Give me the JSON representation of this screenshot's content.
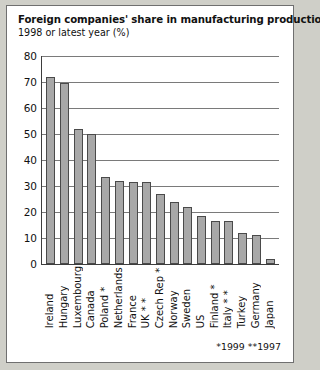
{
  "chart_data": {
    "type": "bar",
    "title": "Foreign companies' share in manufacturing production",
    "subtitle": "1998 or latest year (%)",
    "xlabel": "",
    "ylabel": "",
    "ylim": [
      0,
      80
    ],
    "yticks": [
      80,
      70,
      60,
      50,
      40,
      30,
      20,
      10,
      0
    ],
    "grid": true,
    "legend": null,
    "categories": [
      "Ireland",
      "Hungary",
      "Luxembourg",
      "Canada",
      "Poland *",
      "Netherlands",
      "France",
      "UK * *",
      "Czech Rep *",
      "Norway",
      "Sweden",
      "US",
      "Finland *",
      "Italy * *",
      "Turkey",
      "Germany",
      "Japan"
    ],
    "values": [
      72,
      69.5,
      52,
      50,
      33.5,
      32,
      31.5,
      31.5,
      27,
      24,
      22,
      18.5,
      16.5,
      16.5,
      12,
      11,
      2
    ],
    "bar_color": "#a8a8a8",
    "bar_border_color": "#4a4a4a",
    "annotations": [
      "*1999 **1997"
    ]
  },
  "footnote": "*1999 **1997"
}
